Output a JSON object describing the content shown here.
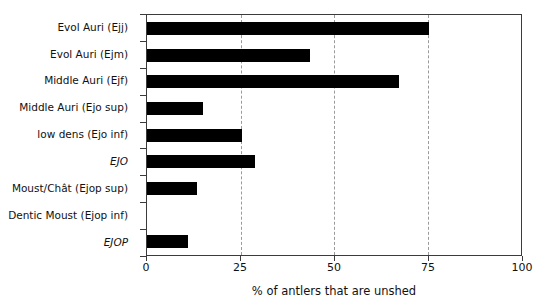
{
  "chart_data": {
    "type": "bar",
    "orientation": "horizontal",
    "title": "",
    "xlabel": "% of antlers that are unshed",
    "ylabel": "",
    "xlim": [
      0,
      100
    ],
    "xticks": [
      0,
      25,
      50,
      75,
      100
    ],
    "xticklabels": [
      "0",
      "25",
      "50",
      "75",
      "100"
    ],
    "grid": "vertical-dashed",
    "legend": "none",
    "bar_color": "#000000",
    "categories": [
      "Evol Auri (Ejj)",
      "Evol Auri (Ejm)",
      "Middle Auri (Ejf)",
      "Middle Auri (Ejo sup)",
      "low dens (Ejo inf)",
      "EJO",
      "Moust/Chât (Ejop sup)",
      "Dentic Moust (Ejop inf)",
      "EJOP"
    ],
    "category_styles": [
      "normal",
      "normal",
      "normal",
      "normal",
      "normal",
      "italic",
      "normal",
      "normal",
      "italic"
    ],
    "values": [
      75.5,
      43.5,
      67.5,
      15,
      25.5,
      29,
      13.5,
      0,
      11
    ]
  }
}
